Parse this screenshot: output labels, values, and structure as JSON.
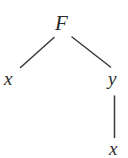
{
  "figure": {
    "type": "tree-diagram",
    "caption": "",
    "background_color": "#ffffff",
    "stroke_color": "#3a3a3a",
    "text_color": "#2b2b2b"
  },
  "nodes": {
    "root": {
      "label": "F",
      "role": "function-symbol"
    },
    "left_child": {
      "label": "x",
      "role": "variable"
    },
    "right_child": {
      "label": "y",
      "role": "variable"
    },
    "grandchild": {
      "label": "x",
      "role": "variable"
    }
  },
  "edges": [
    {
      "id": "edge-root-left",
      "from": "F",
      "to": "x",
      "style": "diagonal-left"
    },
    {
      "id": "edge-root-right",
      "from": "F",
      "to": "y",
      "style": "diagonal-right"
    },
    {
      "id": "edge-right-grandchild",
      "from": "y",
      "to": "x",
      "style": "vertical"
    }
  ]
}
